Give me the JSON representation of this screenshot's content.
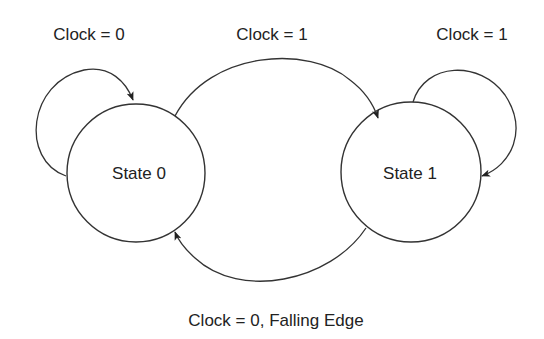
{
  "diagram": {
    "type": "state-machine",
    "states": [
      {
        "id": "state0",
        "label": "State 0"
      },
      {
        "id": "state1",
        "label": "State 1"
      }
    ],
    "transitions": [
      {
        "from": "state0",
        "to": "state0",
        "label": "Clock = 0"
      },
      {
        "from": "state0",
        "to": "state1",
        "label": "Clock = 1"
      },
      {
        "from": "state1",
        "to": "state1",
        "label": "Clock = 1"
      },
      {
        "from": "state1",
        "to": "state0",
        "label": "Clock = 0, Falling Edge"
      }
    ],
    "colors": {
      "stroke": "#333333",
      "text": "#222222",
      "background": "#ffffff"
    }
  }
}
